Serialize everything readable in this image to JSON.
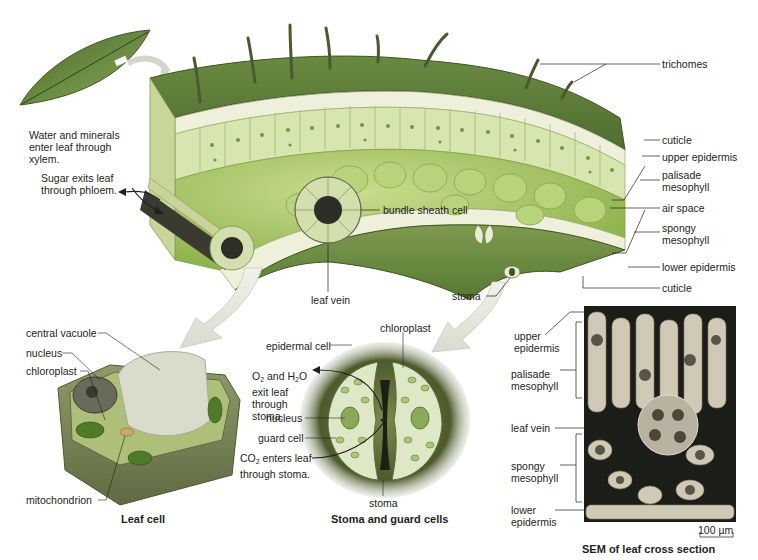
{
  "figure": {
    "type": "leaf anatomy illustration",
    "colors": {
      "epidermis_top": "#5f7a3a",
      "palisade": "#d9e6b0",
      "spongy": "#9cbf5a",
      "chloroplast": "#5a8a2a",
      "vacuole": "#c9c4a8",
      "cell_wall": "#8a8a6a",
      "arrow": "#e8e8e0",
      "sem_bg": "#1a1a18",
      "sem_cell": "#c8c2b0"
    }
  },
  "top_panel": {
    "left_notes": {
      "xylem": "Water and minerals enter leaf through xylem.",
      "phloem": "Sugar exits leaf through phloem."
    },
    "right_labels": [
      {
        "id": "trichomes",
        "text": "trichomes"
      },
      {
        "id": "cuticle_upper",
        "text": "cuticle"
      },
      {
        "id": "upper_epidermis",
        "text": "upper epidermis"
      },
      {
        "id": "palisade_mesophyll",
        "text": "palisade mesophyll"
      },
      {
        "id": "air_space",
        "text": "air space"
      },
      {
        "id": "spongy_mesophyll",
        "text": "spongy mesophyll"
      },
      {
        "id": "lower_epidermis",
        "text": "lower epidermis"
      },
      {
        "id": "cuticle_lower",
        "text": "cuticle"
      }
    ],
    "inner_labels": {
      "bundle_sheath": "bundle sheath cell",
      "leaf_vein": "leaf vein",
      "stoma": "stoma"
    }
  },
  "leaf_cell_panel": {
    "labels": {
      "central_vacuole": "central vacuole",
      "nucleus": "nucleus",
      "chloroplast": "chloroplast",
      "mitochondrion": "mitochondrion"
    },
    "caption": "Leaf cell"
  },
  "stoma_panel": {
    "labels": {
      "chloroplast": "chloroplast",
      "epidermal_cell": "epidermal cell",
      "o2_h2o_line1_a": "O",
      "o2_h2o_sub1": "2",
      "o2_h2o_line1_b": " and H",
      "o2_h2o_sub2": "2",
      "o2_h2o_line1_c": "O",
      "o2_h2o_rest": "exit leaf through stoma.",
      "nucleus": "nucleus",
      "guard_cell": "guard cell",
      "co2_a": "CO",
      "co2_sub": "2",
      "co2_b": " enters leaf",
      "co2_rest": "through stoma.",
      "stoma": "stoma"
    },
    "caption": "Stoma and guard cells"
  },
  "sem_panel": {
    "labels": {
      "upper_epidermis": "upper epidermis",
      "palisade_mesophyll": "palisade mesophyll",
      "leaf_vein": "leaf vein",
      "spongy_mesophyll": "spongy mesophyll",
      "lower_epidermis": "lower epidermis"
    },
    "scale_bar": "100 µm",
    "caption": "SEM of leaf cross section"
  }
}
